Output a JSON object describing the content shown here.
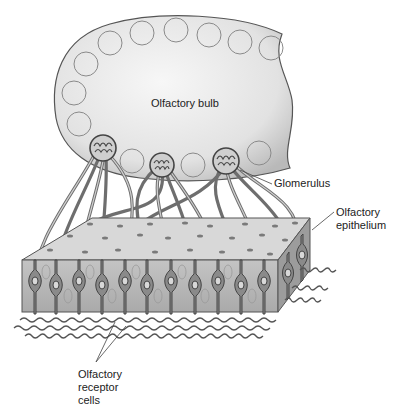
{
  "diagram": {
    "labels": {
      "bulb": "Olfactory bulb",
      "glomerulus": "Glomerulus",
      "epithelium_line1": "Olfactory",
      "epithelium_line2": "epithelium",
      "receptor_line1": "Olfactory",
      "receptor_line2": "receptor",
      "receptor_line3": "cells"
    },
    "colors": {
      "bulb_fill": "#e6e6e6",
      "outline": "#555555",
      "epithelium_top": "#d9d9d9",
      "epithelium_front": "#b8b8b8",
      "epithelium_side": "#9a9a9a",
      "axon": "#7a7a7a"
    }
  }
}
